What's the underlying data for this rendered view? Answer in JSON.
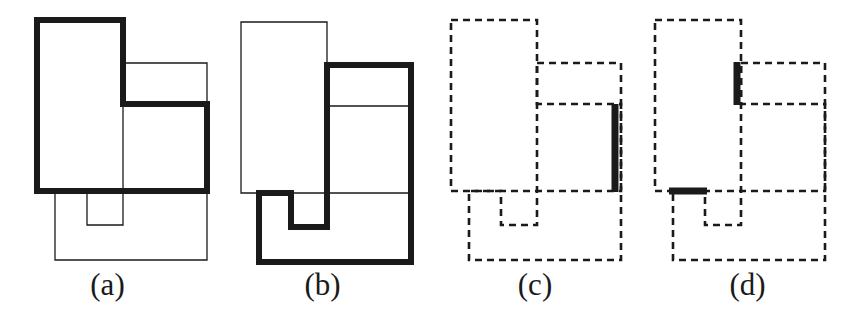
{
  "figure": {
    "background_color": "#ffffff",
    "stroke_color": "#1a1a1a",
    "thin_stroke_width": 1.3,
    "bold_stroke_width": 6,
    "dash_pattern": "7,5",
    "width": 855,
    "height": 322
  },
  "panels": [
    {
      "id": "a",
      "label": "(a)",
      "x": 0,
      "width": 215,
      "description": "Two overlapping rectilinear polygons; the upper-left L-shaped polygon is drawn with a bold solid outline, the lower-right notched polygon with a thin solid outline.",
      "shapes": [
        {
          "name": "thin-polygon",
          "style": "thin",
          "points": "123,63 207,63 207,260 55,260 55,191 87,191 87,225 123,225"
        },
        {
          "name": "bold-polygon",
          "style": "bold",
          "points": "37,20 123,20 123,104 207,104 207,191 37,191"
        }
      ]
    },
    {
      "id": "b",
      "label": "(b)",
      "x": 215,
      "width": 215,
      "description": "Same two polygons as panel (a) but the bold outline is on the lower-right notched polygon and the thin outline on the upper-left L-shaped polygon.",
      "shapes": [
        {
          "name": "thin-polygon",
          "style": "thin",
          "points": "241,22 327,22 327,106 411,106 411,193 241,193"
        },
        {
          "name": "bold-polygon",
          "style": "bold",
          "points": "327,65 411,65 411,262 259,262 259,193 291,193 291,227 327,227"
        }
      ]
    },
    {
      "id": "c",
      "label": "(c)",
      "x": 430,
      "width": 210,
      "description": "Both polygons drawn dashed; one bold solid vertical segment is highlighted on the right boundary.",
      "shapes": [
        {
          "name": "dashed-polygon-upper-left",
          "style": "dashed",
          "points": "451,20 537,20 537,104 621,104 621,191 451,191"
        },
        {
          "name": "dashed-polygon-lower-right",
          "style": "dashed",
          "points": "537,63 621,63 621,260 469,260 469,191 501,191 501,225 537,225"
        },
        {
          "name": "bold-highlight-segment-right",
          "style": "bold-segment",
          "points": "615,104 615,192"
        }
      ]
    },
    {
      "id": "d",
      "label": "(d)",
      "x": 640,
      "width": 215,
      "description": "Both polygons drawn dashed; two bold solid segments are highlighted — a vertical one near the upper middle and a horizontal one on the left of the middle band.",
      "shapes": [
        {
          "name": "dashed-polygon-upper-left",
          "style": "dashed",
          "points": "655,20 741,20 741,104 825,104 825,191 655,191"
        },
        {
          "name": "dashed-polygon-lower-right",
          "style": "dashed",
          "points": "741,63 825,63 825,260 673,260 673,191 705,191 705,225 741,225"
        },
        {
          "name": "bold-highlight-segment-vertical",
          "style": "bold-segment",
          "points": "737,62 737,105"
        },
        {
          "name": "bold-highlight-segment-horizontal",
          "style": "bold-segment",
          "points": "670,191 706,191"
        }
      ]
    }
  ]
}
